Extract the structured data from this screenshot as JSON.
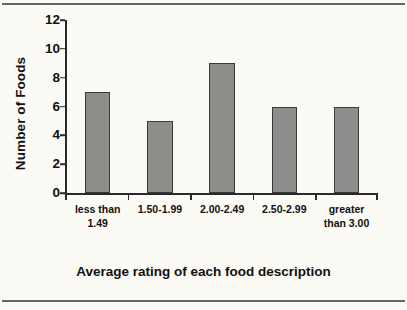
{
  "chart_data": {
    "type": "bar",
    "title": "",
    "xlabel": "Average rating of each food description",
    "ylabel": "Number of Foods",
    "categories": [
      "less than 1.49",
      "1.50-1.99",
      "2.00-2.49",
      "2.50-2.99",
      "greater than 3.00"
    ],
    "values": [
      7,
      5,
      9,
      6,
      6
    ],
    "ylim": [
      0,
      12
    ],
    "yticks": [
      0,
      2,
      4,
      6,
      8,
      10,
      12
    ],
    "ytick_labels": [
      "0",
      "2",
      "4",
      "6",
      "8",
      "10",
      "12"
    ],
    "grid": false,
    "legend": false,
    "bar_color": "#8d8d8b",
    "bar_edge_color": "#3a3a38",
    "axis_color": "#2a2a2a",
    "text_color": "#111111",
    "background_color": "#fbfaf5"
  }
}
